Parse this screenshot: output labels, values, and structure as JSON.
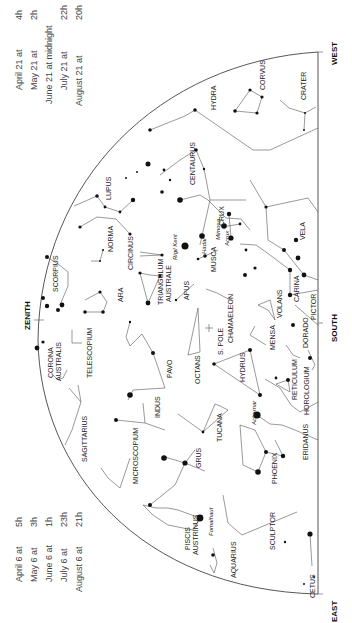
{
  "time_tables": {
    "top": {
      "rows": [
        {
          "date": "April 21 at",
          "hour": "4h"
        },
        {
          "date": "May 21 at",
          "hour": "2h"
        },
        {
          "date": "June 21 at midnight",
          "hour": ""
        },
        {
          "date": "July 21 at",
          "hour": "22h"
        },
        {
          "date": "August 21 at",
          "hour": "20h"
        }
      ]
    },
    "bottom": {
      "rows": [
        {
          "date": "April 6 at",
          "hour": "5h"
        },
        {
          "date": "May 6 at",
          "hour": "3h"
        },
        {
          "date": "June 6 at",
          "hour": "1h"
        },
        {
          "date": "July 6 at",
          "hour": "23h"
        },
        {
          "date": "August 6 at",
          "hour": "21h"
        }
      ]
    }
  },
  "directions": {
    "west": "WEST",
    "south": "SOUTH",
    "east": "EAST",
    "zenith": "ZENITH",
    "pole": "S. POLE"
  },
  "constellations": [
    {
      "name": "HYDRA",
      "x": 213,
      "y": 100
    },
    {
      "name": "CORVUS",
      "x": 262,
      "y": 77
    },
    {
      "name": "CRATER",
      "x": 303,
      "y": 95
    },
    {
      "name": "CENTAURUS",
      "x": 190,
      "y": 170
    },
    {
      "name": "LUPUS",
      "x": 108,
      "y": 190
    },
    {
      "name": "NORMA",
      "x": 110,
      "y": 238
    },
    {
      "name": "CIRCINUS",
      "x": 130,
      "y": 255
    },
    {
      "name": "CRUX",
      "x": 221,
      "y": 216
    },
    {
      "name": "MUSCA",
      "x": 213,
      "y": 258
    },
    {
      "name": "VELA",
      "x": 302,
      "y": 232
    },
    {
      "name": "CARINA",
      "x": 296,
      "y": 286
    },
    {
      "name": "VOLANS",
      "x": 279,
      "y": 301
    },
    {
      "name": "PICTOR",
      "x": 318,
      "y": 305
    },
    {
      "name": "APUS",
      "x": 186,
      "y": 290
    },
    {
      "name": "TRIANGULUM",
      "x": 162,
      "y": 281
    },
    {
      "name": "AUSTRALE",
      "x": 170,
      "y": 281
    },
    {
      "name": "ARA",
      "x": 120,
      "y": 292
    },
    {
      "name": "SCORPIUS",
      "x": 56,
      "y": 272
    },
    {
      "name": "CORONA",
      "x": 50,
      "y": 364
    },
    {
      "name": "AUSTRALIS",
      "x": 58,
      "y": 364
    },
    {
      "name": "TELESCOPIUM",
      "x": 75,
      "y": 372
    },
    {
      "name": "SAGITTARIUS",
      "x": 87,
      "y": 447
    },
    {
      "name": "PAVO",
      "x": 143,
      "y": 378
    },
    {
      "name": "OCTANS",
      "x": 198,
      "y": 362
    },
    {
      "name": "CHAMAELEON",
      "x": 232,
      "y": 332
    },
    {
      "name": "MENSA",
      "x": 274,
      "y": 344
    },
    {
      "name": "DORADO",
      "x": 307,
      "y": 340
    },
    {
      "name": "HYDRUS",
      "x": 245,
      "y": 376
    },
    {
      "name": "RETICULUM",
      "x": 297,
      "y": 391
    },
    {
      "name": "HOROLOGIUM",
      "x": 310,
      "y": 392
    },
    {
      "name": "INDUS",
      "x": 159,
      "y": 414
    },
    {
      "name": "TUCANA",
      "x": 223,
      "y": 433
    },
    {
      "name": "MICROSCOPIUM",
      "x": 135,
      "y": 465
    },
    {
      "name": "GRUS",
      "x": 192,
      "y": 460
    },
    {
      "name": "ERIDANUS",
      "x": 309,
      "y": 447
    },
    {
      "name": "PHOENIX",
      "x": 272,
      "y": 475
    },
    {
      "name": "SCULPTOR",
      "x": 272,
      "y": 538
    },
    {
      "name": "PISCIS",
      "x": 187,
      "y": 542
    },
    {
      "name": "AUSTRINUS",
      "x": 196,
      "y": 542
    },
    {
      "name": "AQUARIUS",
      "x": 234,
      "y": 569
    },
    {
      "name": "CETUS",
      "x": 314,
      "y": 590
    }
  ],
  "star_names": [
    {
      "name": "Rigil Kent",
      "x": 173,
      "y": 241
    },
    {
      "name": "Hadar",
      "x": 202,
      "y": 246
    },
    {
      "name": "Mimosa",
      "x": 219,
      "y": 226
    },
    {
      "name": "Acrux",
      "x": 229,
      "y": 236
    },
    {
      "name": "Achernar",
      "x": 254,
      "y": 411
    },
    {
      "name": "Fomalhaut",
      "x": 214,
      "y": 524
    }
  ]
}
